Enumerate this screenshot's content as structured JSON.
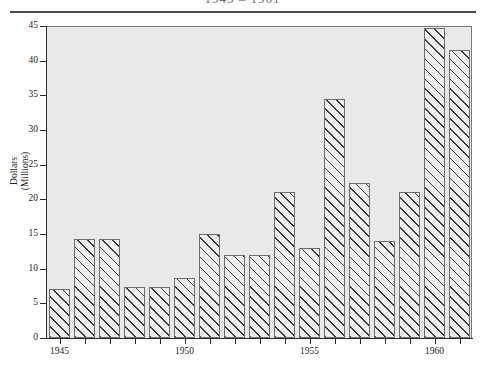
{
  "figure": {
    "title_cut_off": "1945 – 1961",
    "y_axis_title_line1": "Dollars",
    "y_axis_title_line2": "(Millions)"
  },
  "chart_data": {
    "type": "bar",
    "title": "1945 – 1961",
    "xlabel": "",
    "ylabel": "Dollars (Millions)",
    "ylim": [
      0,
      45
    ],
    "ytick_values": [
      0,
      5,
      10,
      15,
      20,
      25,
      30,
      35,
      40,
      45
    ],
    "ytick_labels": [
      "0",
      "5",
      "10",
      "15",
      "20",
      "25",
      "30",
      "35",
      "40",
      "45"
    ],
    "grid": false,
    "legend": "none",
    "plot_background": "#e9e9e7",
    "bar_fill": "#eeeeec",
    "bar_edge": "#6d6d6d",
    "bar_hatch": "diagonal-45",
    "categories": [
      "1945",
      "1946",
      "1947",
      "1948",
      "1949",
      "1950",
      "1951",
      "1952",
      "1953",
      "1954",
      "1955",
      "1956",
      "1957",
      "1958",
      "1959",
      "1960",
      "1961"
    ],
    "xtick_labels_shown": [
      "1945",
      "1950",
      "1955",
      "1960"
    ],
    "values": [
      7.0,
      14.3,
      14.3,
      7.3,
      7.3,
      8.7,
      15.0,
      12.0,
      12.0,
      21.0,
      13.0,
      34.5,
      22.3,
      14.0,
      21.0,
      44.7,
      41.5
    ]
  }
}
